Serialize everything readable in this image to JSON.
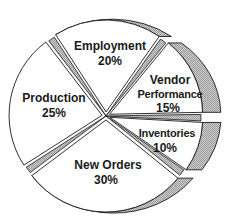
{
  "chart_data": {
    "type": "pie",
    "title": "",
    "style": "exploded 3D pie",
    "slices": [
      {
        "label": "Employment",
        "value": 20,
        "display": "20%"
      },
      {
        "label": "Vendor Performance",
        "value": 15,
        "display": "15%"
      },
      {
        "label": "Inventories",
        "value": 10,
        "display": "10%"
      },
      {
        "label": "New Orders",
        "value": 30,
        "display": "30%"
      },
      {
        "label": "Production",
        "value": 25,
        "display": "25%"
      }
    ],
    "colors": {
      "face": "#ffffff",
      "edge": "#1a1a1a",
      "side_hatch": "#b8b8b8"
    }
  },
  "labels": {
    "employment": {
      "name": "Employment",
      "pct": "20%"
    },
    "vendor": {
      "name_line1": "Vendor",
      "name_line2": "Performance",
      "pct": "15%"
    },
    "inventories": {
      "name": "Inventories",
      "pct": "10%"
    },
    "new_orders": {
      "name": "New Orders",
      "pct": "30%"
    },
    "production": {
      "name": "Production",
      "pct": "25%"
    }
  }
}
